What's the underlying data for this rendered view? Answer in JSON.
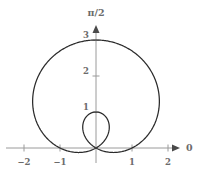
{
  "figure": {
    "background_color": "#ffffff",
    "curve_color": "#2b2b2b",
    "axis_color": "#9a9a9a",
    "label_color": "#6b6b6b"
  },
  "axes": {
    "horizontal_axis_label": "0",
    "vertical_axis_label": "π/2",
    "origin_px": {
      "x": 96,
      "y": 148
    },
    "scale_px_per_unit": 36,
    "x_ticks": [
      {
        "value": -2,
        "label": "−2"
      },
      {
        "value": -1,
        "label": "−1"
      },
      {
        "value": 1,
        "label": "1"
      },
      {
        "value": 2,
        "label": "2"
      }
    ],
    "y_ticks": [
      {
        "value": 1,
        "label": "1"
      },
      {
        "value": 2,
        "label": "2"
      },
      {
        "value": 3,
        "label": "3"
      }
    ],
    "xlim": [
      -2.35,
      2.35
    ],
    "ylim": [
      -0.35,
      3.25
    ]
  },
  "chart_data": {
    "type": "line",
    "title": "",
    "xlabel": "0",
    "ylabel": "π/2",
    "coordinate_system": "polar",
    "grid": false,
    "legend": null,
    "xlim": [
      -2.35,
      2.35
    ],
    "ylim": [
      -0.35,
      3.25
    ],
    "series": [
      {
        "name": "r = 1 + 2 sin(θ)",
        "equation": "r = 1 + 2*sin(theta)",
        "curve_family": "limacon-with-inner-loop",
        "a": 1,
        "b": 2,
        "theta_range_deg": [
          0,
          360
        ],
        "max_radius": 3,
        "max_point_cartesian": [
          0,
          3
        ],
        "widest_half_width": 1.76,
        "inner_loop_tip_cartesian": [
          0,
          1
        ],
        "origin_crossings_theta_deg": [
          210,
          330
        ],
        "points_cartesian": [
          [
            1.0,
            0.0
          ],
          [
            1.214,
            0.214
          ],
          [
            1.396,
            0.457
          ],
          [
            1.537,
            0.724
          ],
          [
            1.63,
            1.008
          ],
          [
            1.673,
            1.302
          ],
          [
            1.663,
            1.6
          ],
          [
            1.603,
            1.892
          ],
          [
            1.496,
            2.172
          ],
          [
            1.348,
            2.432
          ],
          [
            1.165,
            2.664
          ],
          [
            0.956,
            2.862
          ],
          [
            0.729,
            3.02
          ],
          [
            0.493,
            3.133
          ],
          [
            0.257,
            3.197
          ],
          [
            0.027,
            3.209
          ],
          [
            -0.191,
            3.169
          ],
          [
            -0.391,
            3.078
          ],
          [
            -0.568,
            2.94
          ],
          [
            -0.719,
            2.757
          ],
          [
            -0.84,
            2.536
          ],
          [
            -0.929,
            2.283
          ],
          [
            -0.984,
            2.007
          ],
          [
            -1.005,
            1.715
          ],
          [
            -0.993,
            1.417
          ],
          [
            -0.949,
            1.121
          ],
          [
            -0.875,
            0.838
          ],
          [
            -0.775,
            0.574
          ],
          [
            -0.652,
            0.339
          ],
          [
            -0.511,
            0.14
          ],
          [
            -0.357,
            -0.02
          ],
          [
            -0.195,
            -0.137
          ],
          [
            -0.031,
            -0.211
          ],
          [
            0.127,
            -0.243
          ],
          [
            0.272,
            -0.234
          ],
          [
            0.395,
            -0.189
          ],
          [
            0.49,
            -0.113
          ],
          [
            0.552,
            -0.013
          ],
          [
            0.577,
            0.102
          ],
          [
            0.563,
            0.222
          ],
          [
            0.512,
            0.336
          ],
          [
            0.43,
            0.434
          ],
          [
            0.325,
            0.506
          ],
          [
            0.208,
            0.545
          ],
          [
            0.09,
            0.549
          ],
          [
            -0.018,
            0.515
          ],
          [
            -0.105,
            0.447
          ],
          [
            -0.163,
            0.35
          ],
          [
            -0.188,
            0.232
          ],
          [
            -0.18,
            0.105
          ],
          [
            -0.14,
            -0.02
          ],
          [
            -0.075,
            -0.13
          ],
          [
            0.01,
            -0.213
          ],
          [
            0.108,
            -0.258
          ],
          [
            0.21,
            -0.26
          ],
          [
            0.306,
            -0.217
          ],
          [
            0.39,
            -0.133
          ],
          [
            0.452,
            -0.017
          ],
          [
            0.487,
            0.12
          ],
          [
            0.49,
            0.267
          ]
        ]
      }
    ]
  }
}
